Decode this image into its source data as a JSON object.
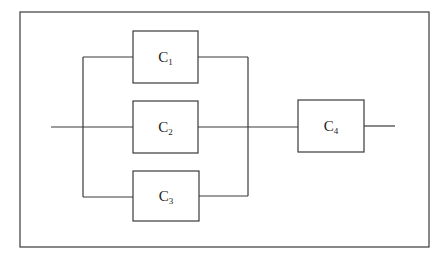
{
  "diagram": {
    "type": "reliability-block-diagram",
    "components": [
      {
        "id": "C1",
        "letter": "C",
        "sub": "1"
      },
      {
        "id": "C2",
        "letter": "C",
        "sub": "2"
      },
      {
        "id": "C3",
        "letter": "C",
        "sub": "3"
      },
      {
        "id": "C4",
        "letter": "C",
        "sub": "4"
      }
    ],
    "connections": {
      "parallel_group": [
        "C1",
        "C2",
        "C3"
      ],
      "series_after_group": "C4"
    },
    "colors": {
      "stroke": "#3a3a3a",
      "background": "#ffffff"
    }
  }
}
